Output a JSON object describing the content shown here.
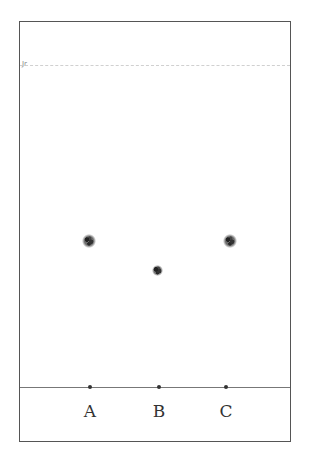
{
  "diagram": {
    "type": "thin-layer-chromatography-plate",
    "solvent_front_mark": "Jr",
    "lanes": [
      {
        "label": "A",
        "origin_x": 89,
        "spot_y": 240
      },
      {
        "label": "B",
        "origin_x": 158,
        "spot_y": 269
      },
      {
        "label": "C",
        "origin_x": 229,
        "spot_y": 240
      }
    ],
    "colors": {
      "border": "#555555",
      "baseline": "#777777",
      "spot": "#333333",
      "solvent_front": "#c8c8c8"
    }
  }
}
